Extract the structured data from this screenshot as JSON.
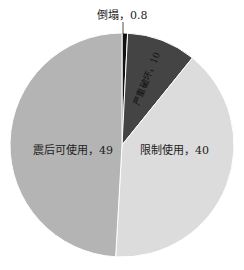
{
  "chart_data": {
    "type": "pie",
    "title": "",
    "slices": [
      {
        "label": "倒塌",
        "value": 0.8,
        "color": "#111111"
      },
      {
        "label": "严重破坏",
        "value": 10,
        "color": "#444444"
      },
      {
        "label": "限制使用",
        "value": 40,
        "color": "#dcdcdc"
      },
      {
        "label": "震后可使用",
        "value": 49,
        "color": "#b4b4b4"
      }
    ],
    "labels_text": [
      "倒塌，0.8",
      "严重破坏，10",
      "限制使用，40",
      "震后可使用，49"
    ],
    "start_angle_deg": 90,
    "direction": "clockwise",
    "legend": "none"
  }
}
